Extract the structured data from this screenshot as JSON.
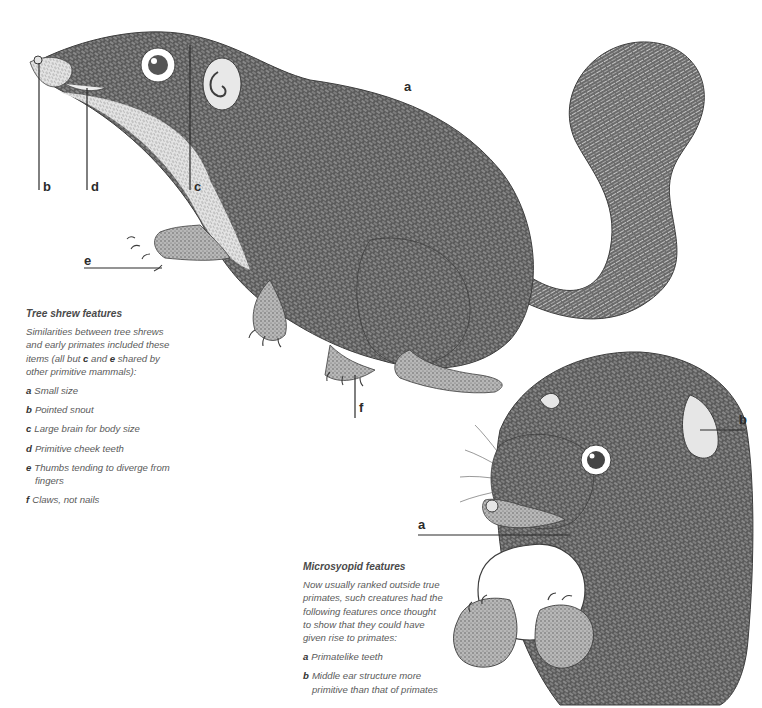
{
  "tree_shrew": {
    "labels": {
      "a": "a",
      "b": "b",
      "c": "c",
      "d": "d",
      "e": "e",
      "f": "f"
    },
    "caption": {
      "title": "Tree shrew features",
      "intro_before": "Similarities between tree shrews and early primates included these items (all but ",
      "intro_c": "c",
      "intro_mid": " and ",
      "intro_e": "e",
      "intro_after": " shared by other primitive mammals):",
      "items": [
        {
          "key": "a",
          "text": "Small size"
        },
        {
          "key": "b",
          "text": "Pointed snout"
        },
        {
          "key": "c",
          "text": "Large brain for body size"
        },
        {
          "key": "d",
          "text": "Primitive cheek teeth"
        },
        {
          "key": "e",
          "text": "Thumbs tending to diverge from fingers"
        },
        {
          "key": "f",
          "text": "Claws, not nails"
        }
      ]
    }
  },
  "microsyopid": {
    "labels": {
      "a": "a",
      "b": "b"
    },
    "caption": {
      "title": "Microsyopid features",
      "intro": "Now usually ranked outside true primates, such creatures had the following features once thought to show that they could have given rise to primates:",
      "items": [
        {
          "key": "a",
          "text": "Primatelike teeth"
        },
        {
          "key": "b",
          "text": "Middle ear structure more primitive than that of primates"
        }
      ]
    }
  },
  "colors": {
    "ink": "#4d4d4d",
    "ink_dark": "#2b2b2b",
    "fur_light": "#d9d9d9",
    "paper": "#ffffff"
  }
}
